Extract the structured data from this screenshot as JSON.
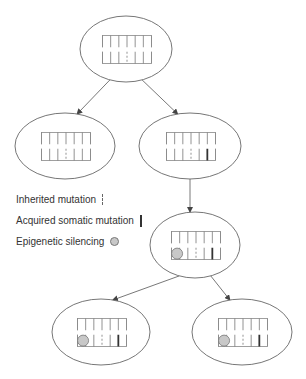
{
  "diagram": {
    "title": "",
    "legend": [
      {
        "key": "inherited",
        "label": "Inherited mutation",
        "symbol": "dashed-line-icon"
      },
      {
        "key": "acquired",
        "label": "Acquired somatic mutation",
        "symbol": "solid-line-icon"
      },
      {
        "key": "epigenetic",
        "label": "Epigenetic silencing",
        "symbol": "gray-circle-icon"
      }
    ],
    "colors": {
      "stroke": "#666666",
      "thick": "#333333",
      "silencing_fill": "#c8c8c8",
      "text": "#333333"
    },
    "gene_slots": 6,
    "cells": [
      {
        "id": "root",
        "level": 0,
        "inherited_slot": 3,
        "acquired_slot": null,
        "silenced_slot": null
      },
      {
        "id": "child-left",
        "level": 1,
        "inherited_slot": 3,
        "acquired_slot": null,
        "silenced_slot": null
      },
      {
        "id": "child-right",
        "level": 1,
        "inherited_slot": 3,
        "acquired_slot": 5,
        "silenced_slot": null
      },
      {
        "id": "grandchild",
        "level": 2,
        "inherited_slot": 3,
        "acquired_slot": 5,
        "silenced_slot": 1
      },
      {
        "id": "great-left",
        "level": 3,
        "inherited_slot": 3,
        "acquired_slot": 5,
        "silenced_slot": 1
      },
      {
        "id": "great-right",
        "level": 3,
        "inherited_slot": 3,
        "acquired_slot": 5,
        "silenced_slot": 1
      }
    ],
    "edges": [
      {
        "from": "root",
        "to": "child-left"
      },
      {
        "from": "root",
        "to": "child-right"
      },
      {
        "from": "child-right",
        "to": "grandchild"
      },
      {
        "from": "grandchild",
        "to": "great-left"
      },
      {
        "from": "grandchild",
        "to": "great-right"
      }
    ]
  }
}
